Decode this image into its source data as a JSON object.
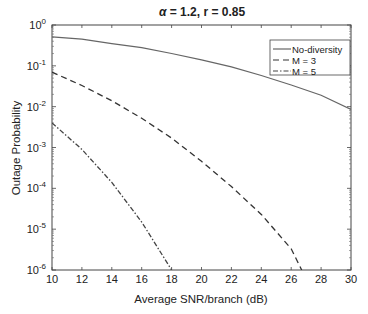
{
  "chart_data": {
    "type": "line",
    "title": "α = 1.2,  r = 0.85",
    "title_parts": {
      "alpha_symbol": "α",
      "rest": " = 1.2,  r = 0.85"
    },
    "xlabel": "Average SNR/branch (dB)",
    "ylabel": "Outage Probability",
    "xlim": [
      10,
      30
    ],
    "ylim": [
      1e-06,
      1
    ],
    "yscale": "log",
    "grid": false,
    "legend_position": "upper right",
    "x_ticks": [
      10,
      12,
      14,
      16,
      18,
      20,
      22,
      24,
      26,
      28,
      30
    ],
    "y_ticks": [
      {
        "base": "10",
        "exp": "0"
      },
      {
        "base": "10",
        "exp": "-1"
      },
      {
        "base": "10",
        "exp": "-2"
      },
      {
        "base": "10",
        "exp": "-3"
      },
      {
        "base": "10",
        "exp": "-4"
      },
      {
        "base": "10",
        "exp": "-5"
      },
      {
        "base": "10",
        "exp": "-6"
      }
    ],
    "series": [
      {
        "name": "No-diversity",
        "style": "solid",
        "color": "#666666",
        "x": [
          10,
          12,
          14,
          16,
          18,
          20,
          22,
          24,
          26,
          28,
          30
        ],
        "values": [
          0.51,
          0.45,
          0.35,
          0.28,
          0.2,
          0.14,
          0.094,
          0.058,
          0.034,
          0.019,
          0.0085
        ]
      },
      {
        "name": "M = 3",
        "style": "dashed",
        "color": "#333333",
        "x": [
          10,
          12,
          14,
          16,
          18,
          20,
          22,
          24,
          26,
          26.7
        ],
        "values": [
          0.07,
          0.033,
          0.014,
          0.0052,
          0.0017,
          0.00046,
          0.00011,
          2.3e-05,
          3.3e-06,
          1e-06
        ]
      },
      {
        "name": "M = 5",
        "style": "dashdot",
        "color": "#444444",
        "x": [
          10,
          12,
          14,
          16,
          18
        ],
        "values": [
          0.004,
          0.0009,
          0.00014,
          1.5e-05,
          1e-06
        ]
      }
    ]
  }
}
